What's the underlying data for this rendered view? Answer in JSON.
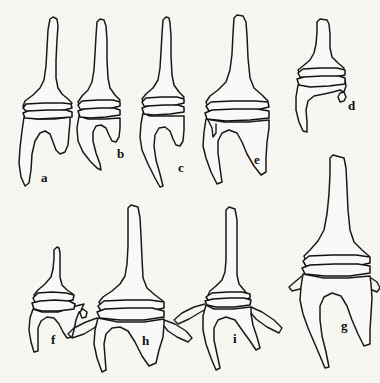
{
  "figure": {
    "background_color": "#f8f7f4",
    "line_color": "#1a1a1a",
    "fill_color": "#fbfaf8",
    "width": 380,
    "height": 383,
    "specimen_count": 9,
    "row_count": 2
  },
  "specimens": [
    {
      "id": "a",
      "label": "a",
      "label_x": 41,
      "label_y": 182,
      "row": "top",
      "description": "Long slender apical spine, flaring cone, double collar band, basal cavity with two downward prongs",
      "body": "M 53 17 L 50 19 L 48 30 L 47 48 L 46 66 L 44 80 L 40 88 L 33 95 L 25 101 L 23 106 L 26 109 L 40 110 L 58 109 L 70 107 L 72 103 L 68 99 L 62 94 L 58 88 L 56 78 L 56 60 L 57 40 L 58 26 L 57 19 Z",
      "collar_top": "M 23 108 L 26 104 L 44 103 L 63 103 L 71 104 L 72 108 L 60 111 L 40 112 L 26 111 Z",
      "collar_bot": "M 23 113 L 28 111 L 48 110 L 66 110 L 72 112 L 72 117 L 58 118 L 38 119 L 25 118 Z",
      "base": "M 24 117 L 22 131 L 20 148 L 19 163 L 21 177 L 25 186 L 29 183 L 31 170 L 32 154 L 35 141 L 40 133 L 45 131 L 50 134 L 53 142 L 56 150 L 60 154 L 65 152 L 68 145 L 69 133 L 70 122 L 70 117 L 55 119 L 38 119 Z"
    },
    {
      "id": "b",
      "label": "b",
      "label_x": 117,
      "label_y": 158,
      "row": "top",
      "description": "Slender spine, narrow cone, collar band, basal cavity with one short anterior prong and one long posterior prong",
      "body": "M 100 19 L 97 22 L 96 36 L 95 54 L 94 70 L 92 82 L 88 90 L 82 96 L 78 102 L 80 106 L 92 107 L 108 106 L 118 104 L 120 100 L 115 95 L 110 88 L 108 78 L 107 60 L 107 40 L 106 26 L 104 20 Z",
      "collar_top": "M 78 105 L 82 101 L 98 100 L 113 100 L 120 102 L 120 106 L 108 109 L 92 110 L 80 109 Z",
      "collar_bot": "M 78 111 L 84 109 L 100 108 L 114 108 L 120 110 L 120 115 L 106 117 L 90 118 L 80 117 Z",
      "base": "M 79 116 L 77 128 L 78 141 L 83 152 L 90 161 L 97 168 L 101 170 L 100 164 L 96 153 L 93 141 L 93 132 L 96 126 L 101 125 L 106 128 L 109 135 L 112 141 L 116 142 L 119 137 L 120 128 L 120 118 L 105 119 L 88 119 Z"
    },
    {
      "id": "c",
      "label": "c",
      "label_x": 178,
      "label_y": 172,
      "row": "top",
      "description": "Tall spine, cone, collar band, basal cavity with long curved anterior prong and short recurved posterior prong",
      "body": "M 166 17 L 163 20 L 162 34 L 161 52 L 160 68 L 158 80 L 153 88 L 146 94 L 142 99 L 144 103 L 156 104 L 172 103 L 182 101 L 184 97 L 179 92 L 174 85 L 172 75 L 171 56 L 171 36 L 170 23 L 169 18 Z",
      "collar_top": "M 142 102 L 146 98 L 162 97 L 177 97 L 184 99 L 184 103 L 172 106 L 156 107 L 144 106 Z",
      "collar_bot": "M 142 108 L 148 106 L 164 105 L 178 105 L 184 107 L 184 112 L 170 114 L 154 115 L 144 114 Z",
      "base": "M 143 113 L 141 124 L 140 137 L 142 150 L 148 164 L 155 178 L 160 187 L 163 186 L 160 174 L 156 160 L 154 146 L 155 135 L 159 128 L 165 127 L 170 131 L 173 139 L 176 145 L 180 146 L 183 141 L 184 130 L 184 116 L 168 116 L 150 116 Z"
    },
    {
      "id": "d",
      "label": "d",
      "label_x": 348,
      "label_y": 110,
      "row": "top",
      "description": "Short stout specimen, broad cone, wide collar band, asymmetric base with single long downward prong",
      "body": "M 320 19 L 317 22 L 317 32 L 316 44 L 314 53 L 310 60 L 303 66 L 298 70 L 300 74 L 312 75 L 330 74 L 342 72 L 344 68 L 338 63 L 332 57 L 330 48 L 330 34 L 329 24 L 327 20 Z",
      "collar_top": "M 298 73 L 303 69 L 320 68 L 337 68 L 345 70 L 345 75 L 330 78 L 312 79 L 300 77 Z",
      "collar_bot": "M 297 79 L 304 77 L 322 76 L 339 76 L 345 78 L 345 84 L 329 86 L 310 87 L 299 85 Z",
      "base": "M 298 85 L 296 97 L 296 110 L 299 122 L 303 131 L 307 132 L 307 122 L 306 110 L 308 101 L 314 96 L 324 94 L 333 92 L 340 90 L 344 92 L 346 97 L 344 101 L 340 102 L 338 97 L 340 93 L 344 92 L 346 86 L 345 80 L 328 83 L 310 84 Z"
    },
    {
      "id": "e",
      "label": "e",
      "label_x": 254,
      "label_y": 164,
      "row": "top",
      "description": "Large specimen with tall spine, broad flaring cone, wide collar band, deep basal cavity with two long prongs and lateral spur",
      "body": "M 237 15 L 234 18 L 233 34 L 232 54 L 230 70 L 226 82 L 218 90 L 210 96 L 206 102 L 208 107 L 222 109 L 244 108 L 262 106 L 268 101 L 262 95 L 254 88 L 250 78 L 248 58 L 247 36 L 246 22 L 243 16 Z",
      "collar_top": "M 206 106 L 211 102 L 232 101 L 255 101 L 268 102 L 269 107 L 252 111 L 230 112 L 209 111 Z",
      "collar_bot": "M 205 113 L 212 110 L 234 109 L 257 109 L 269 111 L 269 118 L 250 120 L 226 121 L 207 119 Z",
      "base": "M 206 119 L 204 132 L 203 146 L 206 158 L 211 172 L 217 184 L 222 182 L 220 168 L 218 153 L 218 141 L 222 133 L 229 130 L 237 133 L 242 142 L 247 154 L 254 166 L 261 175 L 266 172 L 266 158 L 267 142 L 269 128 L 269 120 L 248 122 L 224 122 Z",
      "spur": "M 208 120 L 212 128 L 213 137 L 216 133 L 216 124"
    },
    {
      "id": "f",
      "label": "f",
      "label_x": 51,
      "label_y": 344,
      "row": "bottom",
      "description": "Small specimen with tilted collar band, oblique processes, two short downward prongs",
      "body": "M 57 247 L 54 250 L 54 259 L 53 269 L 51 277 L 45 284 L 38 290 L 34 295 L 36 299 L 46 301 L 58 300 L 70 298 L 73 294 L 67 290 L 62 285 L 60 277 L 60 264 L 60 253 L 59 248 Z",
      "collar_top": "M 33 298 L 38 293 L 52 292 L 66 293 L 74 295 L 73 300 L 58 303 L 44 304 L 35 302 Z",
      "collar_bot": "M 32 303 L 40 301 L 55 300 L 69 301 L 75 304 L 74 309 L 58 311 L 42 311 L 34 309 Z",
      "base": "M 33 309 L 30 318 L 29 330 L 31 342 L 34 352 L 38 351 L 38 340 L 38 328 L 41 321 L 47 317 L 54 318 L 59 324 L 63 332 L 67 338 L 72 337 L 74 330 L 76 320 L 79 312 L 83 309 L 87 312 L 86 317 L 82 318 L 80 313 L 82 308 L 84 304 L 76 306 L 58 312 L 42 312 Z"
    },
    {
      "id": "g",
      "label": "g",
      "label_x": 341,
      "label_y": 330,
      "row": "bottom",
      "description": "Large specimen with long spine, broad cone, thick double collar, wide base with two long divergent prongs and lateral spurs",
      "body": "M 333 155 L 330 158 L 330 174 L 329 194 L 327 214 L 324 230 L 318 241 L 310 250 L 304 256 L 306 262 L 320 265 L 342 264 L 362 262 L 369 256 L 362 250 L 354 242 L 350 230 L 348 210 L 347 188 L 346 168 L 344 158 Z",
      "collar_top": "M 303 261 L 309 256 L 332 255 L 356 255 L 370 257 L 370 263 L 352 267 L 328 268 L 306 266 Z",
      "collar_bot": "M 302 268 L 310 265 L 334 264 L 358 264 L 370 266 L 370 273 L 350 276 L 325 276 L 305 274 Z",
      "base": "M 303 274 L 301 287 L 300 300 L 303 314 L 308 328 L 314 342 L 320 356 L 325 368 L 329 367 L 326 352 L 322 336 L 320 320 L 320 306 L 324 297 L 332 293 L 341 296 L 347 306 L 352 320 L 358 334 L 364 346 L 370 344 L 370 330 L 371 314 L 372 298 L 371 284 L 370 276 L 348 278 L 324 278 Z",
      "spur_left": "M 302 276 L 296 281 L 289 287 L 292 291 L 300 289 L 305 285 L 305 278",
      "spur_right": "M 371 278 L 377 282 L 380 288 L 377 292 L 370 289 L 368 283"
    },
    {
      "id": "h",
      "label": "h",
      "label_x": 142,
      "label_y": 345,
      "row": "bottom",
      "description": "Specimen with very long slender spine, broad flaring cone, wide collar, star-like base with lateral processes and downward prongs",
      "body": "M 131 205 L 128 208 L 128 226 L 128 246 L 127 264 L 125 276 L 120 284 L 112 291 L 103 297 L 99 302 L 102 307 L 116 309 L 136 308 L 156 306 L 163 301 L 155 295 L 147 288 L 143 278 L 142 258 L 141 236 L 140 218 L 138 207 Z",
      "collar_top": "M 98 306 L 104 301 L 126 300 L 150 300 L 164 302 L 164 308 L 146 312 L 122 313 L 101 311 Z",
      "collar_bot": "M 97 312 L 105 309 L 128 308 L 152 308 L 164 311 L 164 317 L 144 320 L 120 320 L 100 318 Z",
      "base": "M 98 318 L 95 330 L 94 344 L 97 358 L 102 372 L 106 370 L 105 357 L 104 344 L 106 334 L 112 328 L 120 327 L 128 331 L 135 342 L 142 356 L 149 366 L 156 363 L 159 350 L 163 337 L 164 324 L 164 319 L 144 322 L 118 322 Z",
      "spur_left": "M 97 318 L 86 322 L 74 328 L 68 334 L 72 338 L 84 334 L 94 328 L 99 323",
      "spur_right": "M 164 320 L 175 324 L 186 331 L 192 338 L 188 342 L 177 337 L 168 331 L 164 326"
    },
    {
      "id": "i",
      "label": "i",
      "label_x": 233,
      "label_y": 343,
      "row": "bottom",
      "description": "Star-shaped specimen with very slender spine, thin narrow collar, three thin radiating processes and downward prongs",
      "body": "M 229 207 L 226 210 L 226 226 L 226 244 L 226 260 L 225 272 L 222 280 L 216 286 L 210 291 L 208 295 L 213 298 L 226 299 L 240 298 L 248 295 L 244 290 L 239 284 L 237 275 L 237 258 L 237 238 L 237 220 L 235 209 Z",
      "collar_top": "M 206 297 L 212 293 L 228 292 L 242 292 L 250 294 L 250 298 L 236 301 L 220 302 L 208 300 Z",
      "collar_bot": "M 205 301 L 213 299 L 229 298 L 244 298 L 251 300 L 250 305 L 234 307 L 216 307 L 207 305 Z",
      "base": "M 206 305 L 203 316 L 203 330 L 206 344 L 211 358 L 216 370 L 220 368 L 217 354 L 214 340 L 214 328 L 218 320 L 226 317 L 235 320 L 242 330 L 250 341 L 256 350 L 260 348 L 257 337 L 253 325 L 251 314 L 251 307 L 233 309 L 214 309 Z",
      "spur_left": "M 205 304 L 194 307 L 182 313 L 174 320 L 178 324 L 189 319 L 199 313 L 206 309",
      "spur_right": "M 251 307 L 262 312 L 274 320 L 282 328 L 279 333 L 267 327 L 256 319 L 251 313"
    }
  ]
}
